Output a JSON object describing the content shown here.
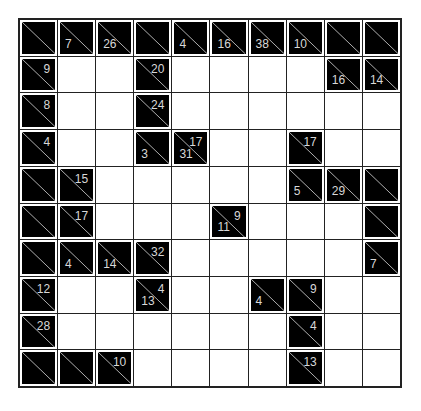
{
  "puzzle": {
    "type": "kakuro",
    "rows": 10,
    "cols": 10,
    "colors": {
      "block": "#000000",
      "empty": "#ffffff",
      "grid_line": "#222222",
      "clue_text": "#d8d8d8"
    },
    "grid": [
      [
        {
          "t": "B"
        },
        {
          "t": "B",
          "d": "7"
        },
        {
          "t": "B",
          "d": "26"
        },
        {
          "t": "B"
        },
        {
          "t": "B",
          "d": "4"
        },
        {
          "t": "B",
          "d": "16"
        },
        {
          "t": "B",
          "d": "38"
        },
        {
          "t": "B",
          "d": "10"
        },
        {
          "t": "B"
        },
        {
          "t": "B"
        }
      ],
      [
        {
          "t": "B",
          "r": "9"
        },
        {
          "t": "W"
        },
        {
          "t": "W"
        },
        {
          "t": "B",
          "r": "20"
        },
        {
          "t": "W"
        },
        {
          "t": "W"
        },
        {
          "t": "W"
        },
        {
          "t": "W"
        },
        {
          "t": "B",
          "d": "16"
        },
        {
          "t": "B",
          "d": "14"
        }
      ],
      [
        {
          "t": "B",
          "r": "8"
        },
        {
          "t": "W"
        },
        {
          "t": "W"
        },
        {
          "t": "B",
          "r": "24"
        },
        {
          "t": "W"
        },
        {
          "t": "W"
        },
        {
          "t": "W"
        },
        {
          "t": "W"
        },
        {
          "t": "W"
        },
        {
          "t": "W"
        }
      ],
      [
        {
          "t": "B",
          "r": "4"
        },
        {
          "t": "W"
        },
        {
          "t": "W"
        },
        {
          "t": "B",
          "d": "3"
        },
        {
          "t": "B",
          "d": "31",
          "r": "17"
        },
        {
          "t": "W"
        },
        {
          "t": "W"
        },
        {
          "t": "B",
          "r": "17"
        },
        {
          "t": "W"
        },
        {
          "t": "W"
        }
      ],
      [
        {
          "t": "B"
        },
        {
          "t": "B",
          "r": "15"
        },
        {
          "t": "W"
        },
        {
          "t": "W"
        },
        {
          "t": "W"
        },
        {
          "t": "W"
        },
        {
          "t": "W"
        },
        {
          "t": "B",
          "d": "5"
        },
        {
          "t": "B",
          "d": "29"
        },
        {
          "t": "B"
        }
      ],
      [
        {
          "t": "B"
        },
        {
          "t": "B",
          "r": "17"
        },
        {
          "t": "W"
        },
        {
          "t": "W"
        },
        {
          "t": "W"
        },
        {
          "t": "B",
          "d": "11",
          "r": "9"
        },
        {
          "t": "W"
        },
        {
          "t": "W"
        },
        {
          "t": "W"
        },
        {
          "t": "B"
        }
      ],
      [
        {
          "t": "B"
        },
        {
          "t": "B",
          "d": "4"
        },
        {
          "t": "B",
          "d": "14"
        },
        {
          "t": "B",
          "r": "32"
        },
        {
          "t": "W"
        },
        {
          "t": "W"
        },
        {
          "t": "W"
        },
        {
          "t": "W"
        },
        {
          "t": "W"
        },
        {
          "t": "B",
          "d": "7"
        }
      ],
      [
        {
          "t": "B",
          "r": "12"
        },
        {
          "t": "W"
        },
        {
          "t": "W"
        },
        {
          "t": "B",
          "d": "13",
          "r": "4"
        },
        {
          "t": "W"
        },
        {
          "t": "W"
        },
        {
          "t": "B",
          "d": "4"
        },
        {
          "t": "B",
          "r": "9"
        },
        {
          "t": "W"
        },
        {
          "t": "W"
        }
      ],
      [
        {
          "t": "B",
          "r": "28"
        },
        {
          "t": "W"
        },
        {
          "t": "W"
        },
        {
          "t": "W"
        },
        {
          "t": "W"
        },
        {
          "t": "W"
        },
        {
          "t": "W"
        },
        {
          "t": "B",
          "r": "4"
        },
        {
          "t": "W"
        },
        {
          "t": "W"
        }
      ],
      [
        {
          "t": "B"
        },
        {
          "t": "B"
        },
        {
          "t": "B",
          "r": "10"
        },
        {
          "t": "W"
        },
        {
          "t": "W"
        },
        {
          "t": "W"
        },
        {
          "t": "W"
        },
        {
          "t": "B",
          "r": "13"
        },
        {
          "t": "W"
        },
        {
          "t": "W"
        }
      ]
    ]
  }
}
